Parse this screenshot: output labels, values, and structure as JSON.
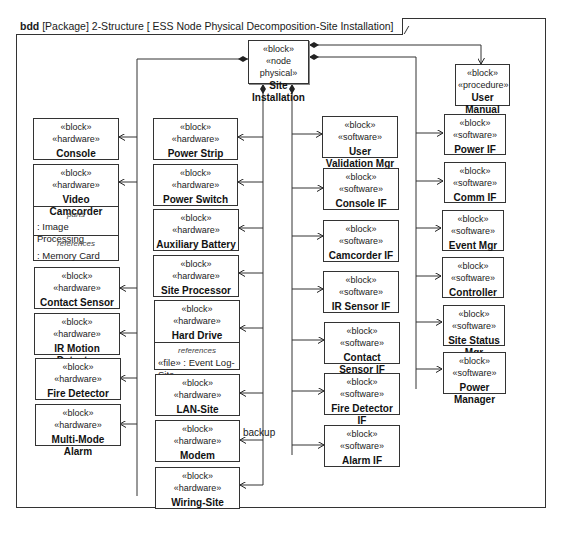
{
  "frame": {
    "kind": "bdd",
    "title": "[Package] 2-Structure [ ESS Node Physical Decomposition-Site Installation]"
  },
  "root": {
    "stereotypes": [
      "«block»",
      "«node physical»"
    ],
    "name": "Site Installation"
  },
  "user_manual": {
    "stereotypes": [
      "«block»",
      "«procedure»"
    ],
    "name": "User Manual"
  },
  "column1": [
    {
      "stereotypes": [
        "«block»",
        "«hardware»"
      ],
      "name": "Console"
    },
    {
      "stereotypes": [
        "«block»",
        "«hardware»"
      ],
      "name": "Video Camcorder",
      "compartments": [
        {
          "title": "parts",
          "value": ": Image Processing"
        },
        {
          "title": "references",
          "value": ": Memory Card"
        }
      ]
    },
    {
      "stereotypes": [
        "«block»",
        "«hardware»"
      ],
      "name": "Contact Sensor"
    },
    {
      "stereotypes": [
        "«block»",
        "«hardware»"
      ],
      "name": "IR Motion Detector"
    },
    {
      "stereotypes": [
        "«block»",
        "«hardware»"
      ],
      "name": "Fire Detector"
    },
    {
      "stereotypes": [
        "«block»",
        "«hardware»"
      ],
      "name": "Multi-Mode Alarm"
    }
  ],
  "column2": [
    {
      "stereotypes": [
        "«block»",
        "«hardware»"
      ],
      "name": "Power Strip"
    },
    {
      "stereotypes": [
        "«block»",
        "«hardware»"
      ],
      "name": "Power Switch"
    },
    {
      "stereotypes": [
        "«block»",
        "«hardware»"
      ],
      "name": "Auxiliary Battery"
    },
    {
      "stereotypes": [
        "«block»",
        "«hardware»"
      ],
      "name": "Site Processor"
    },
    {
      "stereotypes": [
        "«block»",
        "«hardware»"
      ],
      "name": "Hard Drive",
      "compartments": [
        {
          "title": "references",
          "value": "«file» : Event Log-Site"
        }
      ]
    },
    {
      "stereotypes": [
        "«block»",
        "«hardware»"
      ],
      "name": "LAN-Site"
    },
    {
      "stereotypes": [
        "«block»",
        "«hardware»"
      ],
      "name": "Modem"
    },
    {
      "stereotypes": [
        "«block»",
        "«hardware»"
      ],
      "name": "Wiring-Site"
    }
  ],
  "column3": [
    {
      "stereotypes": [
        "«block»",
        "«software»"
      ],
      "name": "User Validation Mgr"
    },
    {
      "stereotypes": [
        "«block»",
        "«software»"
      ],
      "name": "Console IF"
    },
    {
      "stereotypes": [
        "«block»",
        "«software»"
      ],
      "name": "Camcorder IF"
    },
    {
      "stereotypes": [
        "«block»",
        "«software»"
      ],
      "name": "IR Sensor IF"
    },
    {
      "stereotypes": [
        "«block»",
        "«software»"
      ],
      "name": "Contact Sensor IF"
    },
    {
      "stereotypes": [
        "«block»",
        "«software»"
      ],
      "name": "Fire Detector IF"
    },
    {
      "stereotypes": [
        "«block»",
        "«software»"
      ],
      "name": "Alarm IF"
    }
  ],
  "column4": [
    {
      "stereotypes": [
        "«block»",
        "«software»"
      ],
      "name": "Power IF"
    },
    {
      "stereotypes": [
        "«block»",
        "«software»"
      ],
      "name": "Comm IF"
    },
    {
      "stereotypes": [
        "«block»",
        "«software»"
      ],
      "name": "Event Mgr"
    },
    {
      "stereotypes": [
        "«block»",
        "«software»"
      ],
      "name": "Controller"
    },
    {
      "stereotypes": [
        "«block»",
        "«software»"
      ],
      "name": "Site Status Mgr"
    },
    {
      "stereotypes": [
        "«block»",
        "«software»"
      ],
      "name": "Power Manager"
    }
  ],
  "labels": {
    "backup": "backup"
  },
  "colors": {
    "line": "#333333",
    "background": "#ffffff"
  }
}
